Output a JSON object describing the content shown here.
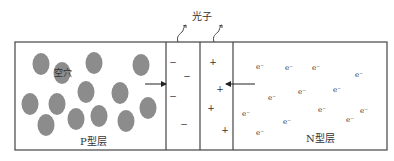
{
  "diagram": {
    "photon_label": "光子",
    "p_layer": {
      "label": "P型层",
      "hole_label": "空穴",
      "holes": [
        [
          41,
          64
        ],
        [
          94,
          63
        ],
        [
          141,
          65
        ],
        [
          62,
          73
        ],
        [
          86,
          92
        ],
        [
          120,
          93
        ],
        [
          30,
          104
        ],
        [
          57,
          104
        ],
        [
          148,
          108
        ],
        [
          46,
          125
        ],
        [
          76,
          119
        ],
        [
          99,
          116
        ],
        [
          126,
          121
        ]
      ]
    },
    "depletion": {
      "negative_symbol": "−",
      "positive_symbol": "+",
      "negatives": [
        [
          173,
          62
        ],
        [
          187,
          76
        ],
        [
          173,
          96
        ],
        [
          184,
          124
        ]
      ],
      "positives": [
        [
          213,
          62
        ],
        [
          220,
          89
        ],
        [
          211,
          108
        ],
        [
          225,
          130
        ]
      ]
    },
    "n_layer": {
      "label": "N型层",
      "electron_symbol": "e⁻",
      "electrons": [
        [
          260,
          67
        ],
        [
          289,
          68
        ],
        [
          316,
          68
        ],
        [
          359,
          75
        ],
        [
          272,
          98
        ],
        [
          302,
          92
        ],
        [
          337,
          90
        ],
        [
          246,
          114
        ],
        [
          322,
          110
        ],
        [
          364,
          111
        ],
        [
          350,
          120
        ],
        [
          287,
          122
        ],
        [
          260,
          133
        ]
      ]
    },
    "colors": {
      "hole": "#8c8c8c",
      "line": "#333333",
      "text": "#333333"
    }
  }
}
